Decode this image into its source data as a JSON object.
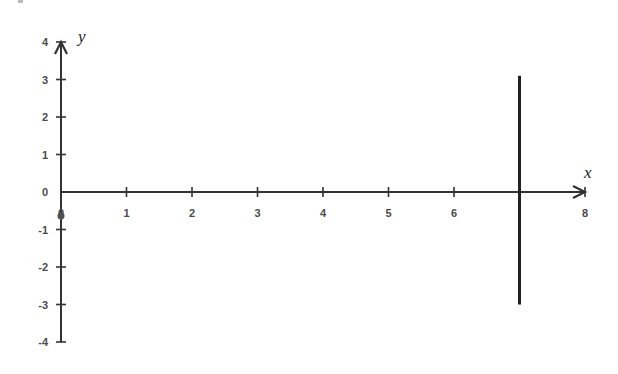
{
  "chart_data": {
    "type": "line",
    "title": "",
    "xlabel": "x",
    "ylabel": "y",
    "xlim": [
      0,
      8
    ],
    "ylim": [
      -4,
      4
    ],
    "x_ticks": [
      0,
      1,
      2,
      3,
      4,
      5,
      6,
      7,
      8
    ],
    "x_tick_labels": [
      "0",
      "1",
      "2",
      "3",
      "4",
      "5",
      "6",
      "",
      "8"
    ],
    "y_ticks": [
      4,
      3,
      2,
      1,
      0,
      -1,
      -2,
      -3,
      -4
    ],
    "y_tick_labels": [
      "4",
      "3",
      "2",
      "1",
      "0",
      "-1",
      "-2",
      "-3",
      "-4"
    ],
    "grid": false,
    "legend": null,
    "series": [
      {
        "name": "vertical line x = 7",
        "x": [
          7,
          7
        ],
        "y": [
          -3,
          3.1
        ]
      }
    ],
    "colors": {
      "axis": "#333333",
      "line": "#222222",
      "labels": "#4a4a4a"
    }
  }
}
